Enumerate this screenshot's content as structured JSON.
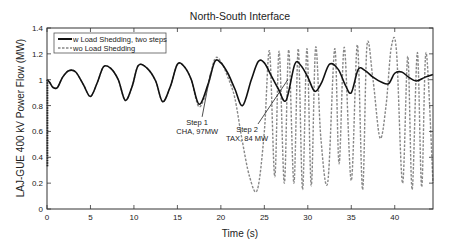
{
  "chart_data": {
    "type": "line",
    "title": "North-South Interface",
    "xlabel": "Time (s)",
    "ylabel": "LAJ-GUE 400 kV Power Flow (MW)",
    "xlim": [
      0,
      44.4
    ],
    "ylim": [
      0,
      1.4
    ],
    "xticks": [
      0,
      5,
      10,
      15,
      20,
      25,
      30,
      35,
      40
    ],
    "yticks": [
      0,
      0.2,
      0.4,
      0.6,
      0.8,
      1,
      1.2,
      1.4
    ],
    "xtick_labels": [
      "0",
      "5",
      "10",
      "15",
      "20",
      "25",
      "30",
      "35",
      "40"
    ],
    "ytick_labels": [
      "0",
      "0.2",
      "0.4",
      "0.6",
      "0.8",
      "1",
      "1.2",
      "1.4"
    ],
    "grid": false,
    "legend_position": "upper-left",
    "series": [
      {
        "name": "w Load Shedding, two steps",
        "style": "solid",
        "color": "#111111",
        "x": [
          0,
          0.3,
          0.7,
          1.2,
          1.8,
          2.5,
          3.3,
          4.2,
          5.0,
          5.8,
          6.5,
          7.3,
          8.2,
          9.0,
          9.8,
          10.5,
          11.5,
          12.5,
          13.3,
          14.2,
          15.0,
          15.8,
          16.6,
          17.5,
          18.5,
          19.3,
          20.0,
          20.8,
          21.6,
          22.5,
          23.5,
          24.3,
          25.0,
          25.8,
          26.6,
          27.5,
          28.5,
          29.2,
          30.0,
          30.8,
          31.6,
          32.5,
          33.5,
          34.3,
          35.0,
          35.8,
          36.6,
          37.5,
          38.5,
          39.3,
          40.0,
          40.8,
          41.6,
          42.5,
          43.5,
          44.4
        ],
        "y": [
          1.0,
          0.98,
          0.94,
          0.94,
          1.02,
          1.07,
          1.06,
          0.96,
          0.87,
          0.98,
          1.1,
          1.09,
          1.0,
          0.84,
          0.95,
          1.11,
          1.09,
          0.99,
          0.83,
          0.95,
          1.12,
          1.1,
          1.0,
          0.81,
          0.96,
          1.14,
          1.13,
          1.05,
          0.93,
          0.8,
          1.0,
          1.14,
          1.13,
          1.03,
          0.93,
          0.84,
          1.12,
          1.11,
          1.02,
          0.91,
          0.98,
          1.12,
          1.08,
          0.96,
          0.9,
          1.08,
          1.07,
          1.02,
          0.98,
          0.97,
          1.05,
          1.06,
          1.02,
          0.99,
          1.02,
          1.04
        ]
      },
      {
        "name": "wo Load Shedding",
        "style": "dashed",
        "color": "#888888",
        "x": [
          0,
          0.3,
          0.7,
          1.2,
          1.8,
          2.5,
          3.3,
          4.2,
          5.0,
          5.8,
          6.5,
          7.3,
          8.2,
          9.0,
          9.8,
          10.5,
          11.5,
          12.5,
          13.3,
          14.2,
          15.0,
          15.8,
          16.6,
          17.5,
          18.5,
          19.3,
          20.0,
          20.8,
          21.6,
          22.4,
          23.3,
          24.2,
          25.0,
          25.6,
          26.2,
          26.7,
          27.3,
          27.8,
          28.4,
          28.9,
          29.4,
          29.9,
          30.4,
          30.9,
          31.5,
          32.3,
          33.1,
          33.6,
          34.2,
          35.0,
          35.7,
          36.3,
          36.8,
          37.5,
          38.3,
          39.0,
          39.6,
          40.2,
          40.9,
          41.5,
          42.0,
          42.6,
          43.1,
          43.6,
          44.4
        ],
        "y": [
          1.0,
          0.98,
          0.94,
          0.94,
          1.02,
          1.07,
          1.06,
          0.96,
          0.87,
          0.98,
          1.1,
          1.09,
          1.0,
          0.84,
          0.95,
          1.11,
          1.09,
          0.99,
          0.83,
          0.95,
          1.12,
          1.1,
          1.0,
          0.79,
          0.95,
          1.16,
          1.14,
          1.02,
          0.86,
          0.55,
          0.25,
          0.15,
          0.6,
          1.22,
          0.25,
          1.22,
          0.2,
          1.23,
          0.2,
          1.24,
          0.15,
          1.24,
          0.18,
          1.25,
          0.55,
          0.21,
          1.24,
          0.35,
          1.25,
          0.22,
          1.27,
          0.15,
          1.26,
          1.0,
          0.55,
          0.8,
          1.25,
          1.22,
          0.2,
          1.18,
          0.15,
          1.21,
          0.17,
          1.21,
          0.2
        ]
      }
    ],
    "annotations": [
      {
        "text_line1": "Step 1",
        "text_line2": "CHA, 97MW",
        "x": 17.5,
        "y": 0.62,
        "arrow_to": [
          18.8,
          1.05
        ]
      },
      {
        "text_line1": "Step 2",
        "text_line2": "TAX, 84 MW",
        "x": 24.5,
        "y": 0.58,
        "arrow_to": [
          27.7,
          1.0
        ]
      }
    ]
  }
}
